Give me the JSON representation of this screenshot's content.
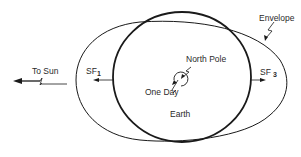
{
  "diagram": {
    "labels": {
      "to_sun": "To Sun",
      "sf1": "SF",
      "sf1_sub": "1",
      "sf3": "SF",
      "sf3_sub": "3",
      "north_pole": "North Pole",
      "one_day": "One Day",
      "earth": "Earth",
      "envelope": "Envelope"
    },
    "colors": {
      "stroke": "#1a1a1a",
      "text": "#2a2a2a",
      "background": "#ffffff"
    }
  }
}
